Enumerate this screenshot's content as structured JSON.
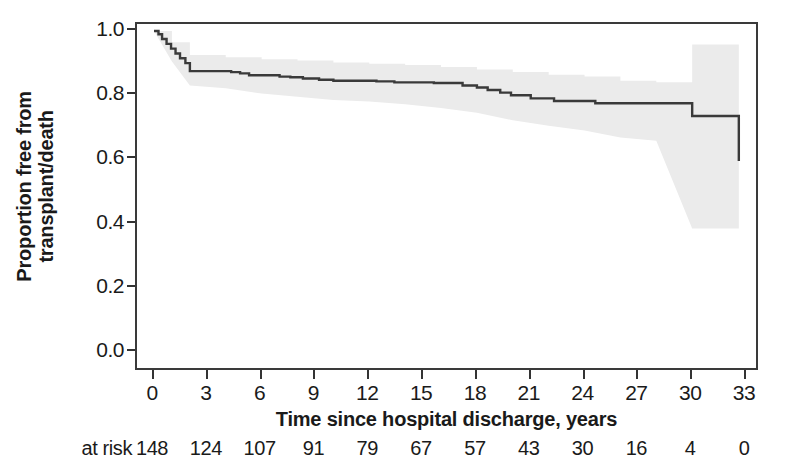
{
  "chart_data": {
    "type": "line",
    "title": "",
    "xlabel": "Time since hospital discharge, years",
    "ylabel_lines": [
      "Proportion free from",
      "transplant/death"
    ],
    "ylabel": "Proportion free from transplant/death",
    "xlim": [
      0,
      33
    ],
    "ylim": [
      0.0,
      1.0
    ],
    "grid": false,
    "legend": "none",
    "xticks": [
      0,
      3,
      6,
      9,
      12,
      15,
      18,
      21,
      24,
      27,
      30,
      33
    ],
    "xtick_labels": [
      "0",
      "3",
      "6",
      "9",
      "12",
      "15",
      "18",
      "21",
      "24",
      "27",
      "30",
      "33"
    ],
    "yticks": [
      0.0,
      0.2,
      0.4,
      0.6,
      0.8,
      1.0
    ],
    "ytick_labels": [
      "0.0",
      "0.2",
      "0.4",
      "0.6",
      "0.8",
      "1.0"
    ],
    "curve_color": "#3a3a3a",
    "band_color": "#ebebeb",
    "series": [
      {
        "name": "Kaplan-Meier survival estimate",
        "style": "step-post",
        "x": [
          0.0,
          0.25,
          0.45,
          0.7,
          0.95,
          1.2,
          1.45,
          1.75,
          2.0,
          4.3,
          4.8,
          5.3,
          7.0,
          7.6,
          8.3,
          9.2,
          10.0,
          12.4,
          13.4,
          15.6,
          17.2,
          18.0,
          18.6,
          19.3,
          19.9,
          21.0,
          22.3,
          24.6,
          30.0,
          32.6
        ],
        "values": [
          1.0,
          0.99,
          0.975,
          0.96,
          0.945,
          0.93,
          0.915,
          0.9,
          0.875,
          0.872,
          0.868,
          0.862,
          0.858,
          0.856,
          0.852,
          0.848,
          0.845,
          0.843,
          0.84,
          0.838,
          0.83,
          0.824,
          0.816,
          0.808,
          0.8,
          0.79,
          0.782,
          0.775,
          0.735,
          0.595
        ]
      }
    ],
    "confidence_band": {
      "name": "95% confidence interval",
      "x": [
        0.0,
        1.0,
        2.0,
        4.0,
        6.0,
        8.0,
        10.0,
        12.0,
        14.0,
        16.0,
        18.0,
        20.0,
        22.0,
        24.0,
        26.0,
        28.0,
        30.0,
        32.6
      ],
      "upper": [
        1.0,
        0.965,
        0.925,
        0.918,
        0.912,
        0.908,
        0.902,
        0.898,
        0.894,
        0.888,
        0.88,
        0.872,
        0.864,
        0.858,
        0.845,
        0.84,
        0.958,
        0.958
      ],
      "lower": [
        1.0,
        0.905,
        0.83,
        0.822,
        0.805,
        0.795,
        0.785,
        0.78,
        0.772,
        0.76,
        0.745,
        0.722,
        0.705,
        0.69,
        0.668,
        0.658,
        0.385,
        0.385
      ]
    },
    "at_risk": {
      "caption": "at risk",
      "times": [
        0,
        3,
        6,
        9,
        12,
        15,
        18,
        21,
        24,
        27,
        30,
        33
      ],
      "counts": [
        "148",
        "124",
        "107",
        "91",
        "79",
        "67",
        "57",
        "43",
        "30",
        "16",
        "4",
        "0"
      ]
    }
  }
}
